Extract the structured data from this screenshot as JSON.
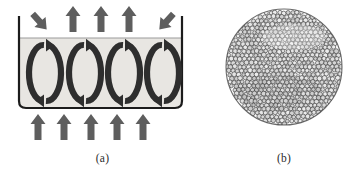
{
  "figure": {
    "background_color": "#ffffff",
    "width": 363,
    "height": 176
  },
  "panel_a": {
    "caption": "(a)",
    "description": "Convection rolls in a shallow liquid layer heated from below",
    "vessel": {
      "wall_color": "#1c1c1c",
      "fluid_color": "#e8e6e2",
      "surface_line_color": "#9a9a9a",
      "x": 19,
      "y": 16,
      "width": 163,
      "height": 92,
      "fluid_top": 38
    },
    "roll_cells": {
      "count": 4,
      "color": "#2e2e2e",
      "label": "convection-roll",
      "centers_x": [
        45,
        85,
        124,
        163
      ],
      "top_arrow_direction": "right",
      "bottom_arrow_direction": "left"
    },
    "heat_arrows_bottom": {
      "count": 5,
      "color": "#5e5e5e",
      "direction": "up",
      "meaning": "heat input from below",
      "centers_x": [
        38,
        64,
        91,
        117,
        143
      ]
    },
    "heat_arrows_top": {
      "count": 3,
      "color": "#5e5e5e",
      "direction": "up",
      "meaning": "heat escaping at the surface",
      "centers_x": [
        73,
        101,
        129
      ]
    },
    "inflow_arrows_top": {
      "count": 2,
      "color": "#5e5e5e",
      "items": [
        {
          "name": "inflow-arrow-left",
          "direction": "down-right",
          "x": 40,
          "y": 22
        },
        {
          "name": "inflow-arrow-right",
          "direction": "down-left",
          "x": 166,
          "y": 22
        }
      ]
    }
  },
  "panel_b": {
    "caption": "(b)",
    "description": "Top view of Benard convection cells forming a close-packed pattern within a circular dish",
    "disc": {
      "center_x": 79,
      "center_y": 67,
      "radius": 58,
      "outline_color": "#3a3a3a",
      "fill_color": "#fdfdfd"
    },
    "cells": {
      "approx_count": 760,
      "cell_diameter_px": 4.4,
      "packing": "hexagonal",
      "cell_fill": "#f2f2f2",
      "cell_stroke": "#3c3c3c"
    }
  }
}
